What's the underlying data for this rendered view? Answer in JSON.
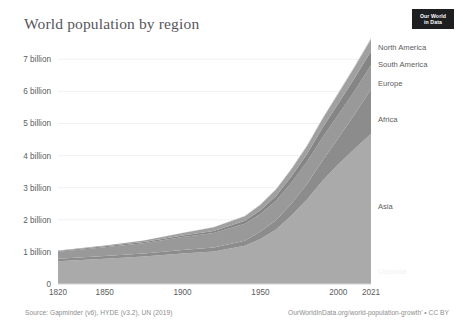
{
  "header": {
    "title": "World population by region",
    "logo_line1": "Our World",
    "logo_line2": "in Data"
  },
  "footer": {
    "source": "Source: Gapminder (v6), HYDE (v3.2), UN (2019)",
    "attribution": "OurWorldInData.org/world-population-growth' • CC BY"
  },
  "chart_data": {
    "type": "area",
    "stacked": true,
    "title": "World population by region",
    "xlabel": "",
    "ylabel": "",
    "xlim": [
      1820,
      2021
    ],
    "ylim": [
      0,
      7600000000
    ],
    "grid": true,
    "legend_position": "right-inline",
    "xticks": [
      1820,
      1850,
      1900,
      1950,
      2000,
      2021
    ],
    "xtick_labels": [
      "1820",
      "1850",
      "1900",
      "1950",
      "2000",
      "2021"
    ],
    "yticks": [
      0,
      1000000000,
      2000000000,
      3000000000,
      4000000000,
      5000000000,
      6000000000,
      7000000000
    ],
    "ytick_labels": [
      "0",
      "1 billion",
      "2 billion",
      "3 billion",
      "4 billion",
      "5 billion",
      "6 billion",
      "7 billion"
    ],
    "x": [
      1820,
      1850,
      1875,
      1900,
      1920,
      1940,
      1950,
      1960,
      1970,
      1980,
      1990,
      2000,
      2010,
      2021
    ],
    "series": [
      {
        "name": "Asia",
        "color": "#aaaaaa",
        "values": [
          710000000,
          790000000,
          860000000,
          950000000,
          1010000000,
          1190000000,
          1405000000,
          1700000000,
          2140000000,
          2640000000,
          3220000000,
          3730000000,
          4190000000,
          4680000000
        ]
      },
      {
        "name": "Africa",
        "color": "#8c8c8c",
        "values": [
          74000000,
          81000000,
          90000000,
          108000000,
          125000000,
          160000000,
          228000000,
          285000000,
          365000000,
          481000000,
          638000000,
          819000000,
          1055000000,
          1390000000
        ]
      },
      {
        "name": "Europe",
        "color": "#999999",
        "values": [
          224000000,
          276000000,
          322000000,
          408000000,
          454000000,
          530000000,
          549000000,
          606000000,
          657000000,
          694000000,
          721000000,
          726000000,
          736000000,
          745000000
        ]
      },
      {
        "name": "South America",
        "color": "#858585",
        "values": [
          21000000,
          26000000,
          33000000,
          43000000,
          62000000,
          89000000,
          114000000,
          148000000,
          191000000,
          241000000,
          295000000,
          348000000,
          393000000,
          434000000
        ]
      },
      {
        "name": "North America",
        "color": "#a0a0a0",
        "values": [
          11000000,
          26000000,
          48000000,
          82000000,
          116000000,
          144000000,
          173000000,
          204000000,
          231000000,
          254000000,
          280000000,
          313000000,
          343000000,
          371000000
        ]
      },
      {
        "name": "Oceania",
        "color": "#c4c4c4",
        "values": [
          2000000,
          2000000,
          3000000,
          6000000,
          8000000,
          11000000,
          13000000,
          16000000,
          19000000,
          23000000,
          27000000,
          31000000,
          37000000,
          43000000
        ]
      }
    ],
    "inline_labels": [
      {
        "name": "North America",
        "x": 378,
        "y": 50
      },
      {
        "name": "South America",
        "x": 378,
        "y": 67
      },
      {
        "name": "Europe",
        "x": 378,
        "y": 86
      },
      {
        "name": "Africa",
        "x": 378,
        "y": 122
      },
      {
        "name": "Asia",
        "x": 378,
        "y": 209
      },
      {
        "name": "Oceania",
        "x": 378,
        "y": 274
      }
    ]
  }
}
